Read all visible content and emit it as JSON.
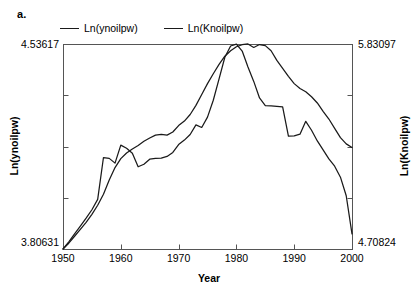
{
  "panel": {
    "label": "a."
  },
  "legend": {
    "items": [
      {
        "name": "Ln(ynoilpw)",
        "color": "#1a1a1a"
      },
      {
        "name": "Ln(Knoilpw)",
        "color": "#1a1a1a"
      }
    ]
  },
  "axes": {
    "x_title": "Year",
    "y_left_title": "Ln(ynoilpw)",
    "y_right_title": "Ln(Knoilpw)",
    "y_left_max": "4.53617",
    "y_left_min": "3.80631",
    "y_right_max": "5.83097",
    "y_right_min": "4.70824",
    "x_ticks": [
      "1950",
      "1960",
      "1970",
      "1980",
      "1990",
      "2000"
    ]
  },
  "chart_data": {
    "type": "line",
    "title": "",
    "xlabel": "Year",
    "ylabel": "Ln(ynoilpw)",
    "ylabel_right": "Ln(Knoilpw)",
    "xlim": [
      1950,
      2000
    ],
    "ylim_left": [
      3.80631,
      4.53617
    ],
    "ylim_right": [
      4.70824,
      5.83097
    ],
    "grid": false,
    "legend_position": "top",
    "x_tick_labels": [
      "1950",
      "1960",
      "1970",
      "1980",
      "1990",
      "2000"
    ],
    "x": [
      1950,
      1951,
      1952,
      1953,
      1954,
      1955,
      1956,
      1957,
      1958,
      1959,
      1960,
      1961,
      1962,
      1963,
      1964,
      1965,
      1966,
      1967,
      1968,
      1969,
      1970,
      1971,
      1972,
      1973,
      1974,
      1975,
      1976,
      1977,
      1978,
      1979,
      1980,
      1981,
      1982,
      1983,
      1984,
      1985,
      1986,
      1987,
      1988,
      1989,
      1990,
      1991,
      1992,
      1993,
      1994,
      1995,
      1996,
      1997,
      1998,
      1999,
      2000
    ],
    "series": [
      {
        "name": "Ln(ynoilpw)",
        "axis": "left",
        "color": "#1a1a1a",
        "values": [
          3.8063,
          3.832,
          3.86,
          3.888,
          3.916,
          3.946,
          3.983,
          4.132,
          4.129,
          4.112,
          4.176,
          4.165,
          4.147,
          4.099,
          4.108,
          4.126,
          4.129,
          4.13,
          4.136,
          4.15,
          4.178,
          4.194,
          4.214,
          4.248,
          4.239,
          4.276,
          4.336,
          4.412,
          4.489,
          4.529,
          4.536,
          4.511,
          4.454,
          4.403,
          4.344,
          4.317,
          4.316,
          4.314,
          4.312,
          4.208,
          4.209,
          4.215,
          4.261,
          4.229,
          4.191,
          4.159,
          4.127,
          4.101,
          4.062,
          3.996,
          3.86
        ]
      },
      {
        "name": "Ln(Knoilpw)",
        "axis": "right",
        "color": "#1a1a1a",
        "values": [
          4.7082,
          4.74,
          4.778,
          4.816,
          4.854,
          4.898,
          4.948,
          5.008,
          5.086,
          5.154,
          5.203,
          5.234,
          5.256,
          5.275,
          5.298,
          5.316,
          5.332,
          5.336,
          5.332,
          5.349,
          5.384,
          5.409,
          5.445,
          5.495,
          5.554,
          5.614,
          5.668,
          5.719,
          5.764,
          5.794,
          5.816,
          5.827,
          5.831,
          5.812,
          5.828,
          5.822,
          5.794,
          5.741,
          5.698,
          5.654,
          5.614,
          5.587,
          5.569,
          5.542,
          5.508,
          5.462,
          5.42,
          5.369,
          5.318,
          5.284,
          5.264
        ]
      }
    ]
  },
  "geometry": {
    "plot_left": 63,
    "plot_right": 352,
    "plot_top": 44,
    "plot_bottom": 249
  }
}
